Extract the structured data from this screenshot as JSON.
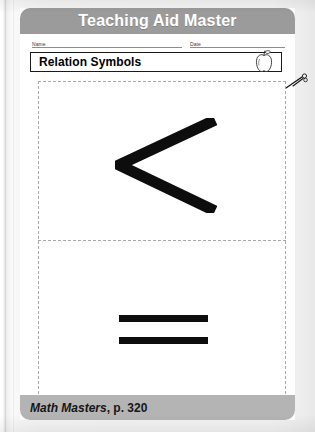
{
  "page": {
    "header_title": "Teaching Aid Master",
    "footer_source": "Math Masters",
    "footer_page": ", p. 320"
  },
  "fields": {
    "name_label": "Name",
    "date_label": "Date"
  },
  "title_bar": {
    "title": "Relation Symbols",
    "icon": "apple-icon"
  },
  "cut_marker": {
    "icon": "scissors-icon"
  },
  "cards": [
    {
      "symbol": "<",
      "symbol_name": "less-than-symbol"
    },
    {
      "symbol": "=",
      "symbol_name": "equals-symbol"
    }
  ],
  "colors": {
    "header_band": "#9b9b9b",
    "footer_band": "#b4b4b4",
    "symbol_ink": "#0d0d0d",
    "cut_line": "#a8a8a8"
  }
}
